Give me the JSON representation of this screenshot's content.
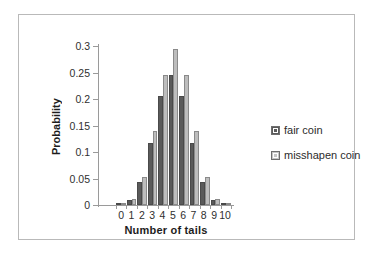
{
  "chart_data": {
    "type": "bar",
    "title": "",
    "xlabel": "Number of tails",
    "ylabel": "Probability",
    "categories": [
      "0",
      "1",
      "2",
      "3",
      "4",
      "5",
      "6",
      "7",
      "8",
      "9",
      "10"
    ],
    "series": [
      {
        "name": "fair coin",
        "color": "#5a5a5a",
        "values": [
          0.001,
          0.0098,
          0.044,
          0.117,
          0.205,
          0.246,
          0.205,
          0.117,
          0.044,
          0.0098,
          0.001
        ]
      },
      {
        "name": "misshapen coin",
        "color": "#bdbdbd",
        "values": [
          0.0012,
          0.0115,
          0.053,
          0.14,
          0.246,
          0.295,
          0.246,
          0.14,
          0.053,
          0.0115,
          0.0012
        ]
      }
    ],
    "ylim": [
      0,
      0.3
    ],
    "yticks": [
      0,
      0.05,
      0.1,
      0.15,
      0.2,
      0.25,
      0.3
    ],
    "ytick_labels": [
      "0",
      "0.05",
      "0.1",
      "0.15",
      "0.2",
      "0.25",
      "0.3"
    ],
    "grid": false,
    "legend_position": "right",
    "legend": [
      "fair coin",
      "misshapen coin"
    ]
  }
}
